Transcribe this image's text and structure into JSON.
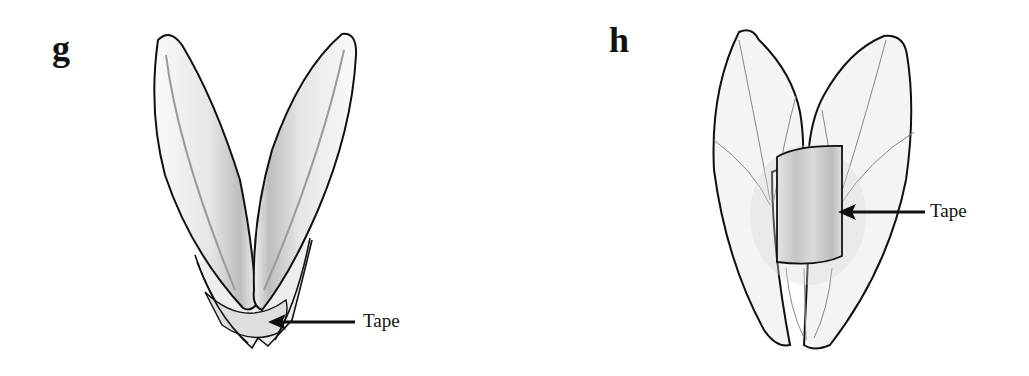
{
  "figure": {
    "panels": [
      {
        "id": "g",
        "label": "g",
        "subject": "two-petaled floral structure opened in a V shape",
        "annotation": {
          "text": "Tape",
          "arrow_target": "tape at base of petals"
        }
      },
      {
        "id": "h",
        "label": "h",
        "subject": "two-petaled floral structure closed with a band",
        "annotation": {
          "text": "Tape",
          "arrow_target": "tape band wrapped around the middle"
        }
      }
    ],
    "colors": {
      "outline": "#111111",
      "petal_fill": "#f2f2f2",
      "petal_shade": "#cfcfcf",
      "tape_fill": "#d6d6d6",
      "background": "#ffffff"
    }
  }
}
